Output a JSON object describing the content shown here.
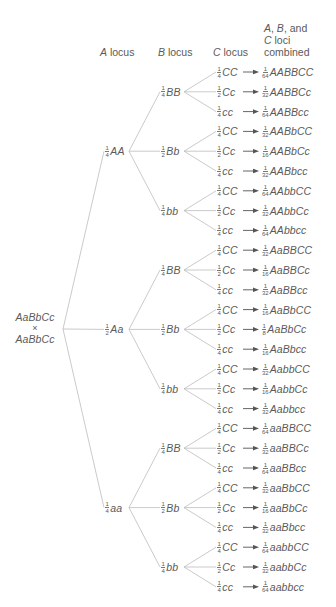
{
  "headers": {
    "a_locus": {
      "italic": "A",
      "rest": " locus"
    },
    "b_locus": {
      "italic": "B",
      "rest": " locus"
    },
    "c_locus": {
      "italic": "C",
      "rest": " locus"
    },
    "combined": {
      "line1_a": "A",
      "line1_sep": ", ",
      "line1_b": "B",
      "line1_rest": ", and",
      "line2_c": "C",
      "line2_rest": " loci",
      "line3": "combined"
    }
  },
  "root": {
    "parent1": "AaBbCc",
    "cross": "×",
    "parent2": "AaBbCc"
  },
  "a_nodes": [
    {
      "num": "1",
      "den": "4",
      "genotype": "AA"
    },
    {
      "num": "1",
      "den": "2",
      "genotype": "Aa"
    },
    {
      "num": "1",
      "den": "4",
      "genotype": "aa"
    }
  ],
  "b_nodes": [
    {
      "num": "1",
      "den": "4",
      "genotype": "BB"
    },
    {
      "num": "1",
      "den": "2",
      "genotype": "Bb"
    },
    {
      "num": "1",
      "den": "4",
      "genotype": "bb"
    },
    {
      "num": "1",
      "den": "4",
      "genotype": "BB"
    },
    {
      "num": "1",
      "den": "2",
      "genotype": "Bb"
    },
    {
      "num": "1",
      "den": "4",
      "genotype": "bb"
    },
    {
      "num": "1",
      "den": "4",
      "genotype": "BB"
    },
    {
      "num": "1",
      "den": "2",
      "genotype": "Bb"
    },
    {
      "num": "1",
      "den": "4",
      "genotype": "bb"
    }
  ],
  "rows": [
    {
      "c_num": "1",
      "c_den": "4",
      "c_genotype": "CC",
      "p_num": "1",
      "p_den": "64",
      "combined": "AABBCC"
    },
    {
      "c_num": "1",
      "c_den": "2",
      "c_genotype": "Cc",
      "p_num": "1",
      "p_den": "32",
      "combined": "AABBCc"
    },
    {
      "c_num": "1",
      "c_den": "4",
      "c_genotype": "cc",
      "p_num": "1",
      "p_den": "64",
      "combined": "AABBcc"
    },
    {
      "c_num": "1",
      "c_den": "4",
      "c_genotype": "CC",
      "p_num": "1",
      "p_den": "32",
      "combined": "AABbCC"
    },
    {
      "c_num": "1",
      "c_den": "2",
      "c_genotype": "Cc",
      "p_num": "1",
      "p_den": "16",
      "combined": "AABbCc"
    },
    {
      "c_num": "1",
      "c_den": "4",
      "c_genotype": "cc",
      "p_num": "1",
      "p_den": "32",
      "combined": "AABbcc"
    },
    {
      "c_num": "1",
      "c_den": "4",
      "c_genotype": "CC",
      "p_num": "1",
      "p_den": "64",
      "combined": "AAbbCC"
    },
    {
      "c_num": "1",
      "c_den": "2",
      "c_genotype": "Cc",
      "p_num": "1",
      "p_den": "32",
      "combined": "AAbbCc"
    },
    {
      "c_num": "1",
      "c_den": "4",
      "c_genotype": "cc",
      "p_num": "1",
      "p_den": "64",
      "combined": "AAbbcc"
    },
    {
      "c_num": "1",
      "c_den": "4",
      "c_genotype": "CC",
      "p_num": "1",
      "p_den": "32",
      "combined": "AaBBCC"
    },
    {
      "c_num": "1",
      "c_den": "2",
      "c_genotype": "Cc",
      "p_num": "1",
      "p_den": "16",
      "combined": "AaBBCc"
    },
    {
      "c_num": "1",
      "c_den": "4",
      "c_genotype": "cc",
      "p_num": "1",
      "p_den": "32",
      "combined": "AaBBcc"
    },
    {
      "c_num": "1",
      "c_den": "4",
      "c_genotype": "CC",
      "p_num": "1",
      "p_den": "16",
      "combined": "AaBbCC"
    },
    {
      "c_num": "1",
      "c_den": "2",
      "c_genotype": "Cc",
      "p_num": "1",
      "p_den": "8",
      "combined": "AaBbCc"
    },
    {
      "c_num": "1",
      "c_den": "4",
      "c_genotype": "cc",
      "p_num": "1",
      "p_den": "16",
      "combined": "AaBbcc"
    },
    {
      "c_num": "1",
      "c_den": "4",
      "c_genotype": "CC",
      "p_num": "1",
      "p_den": "32",
      "combined": "AabbCC"
    },
    {
      "c_num": "1",
      "c_den": "2",
      "c_genotype": "Cc",
      "p_num": "1",
      "p_den": "16",
      "combined": "AabbCc"
    },
    {
      "c_num": "1",
      "c_den": "4",
      "c_genotype": "cc",
      "p_num": "1",
      "p_den": "32",
      "combined": "Aabbcc"
    },
    {
      "c_num": "1",
      "c_den": "4",
      "c_genotype": "CC",
      "p_num": "1",
      "p_den": "64",
      "combined": "aaBBCC"
    },
    {
      "c_num": "1",
      "c_den": "2",
      "c_genotype": "Cc",
      "p_num": "1",
      "p_den": "32",
      "combined": "aaBBCc"
    },
    {
      "c_num": "1",
      "c_den": "4",
      "c_genotype": "cc",
      "p_num": "1",
      "p_den": "64",
      "combined": "aaBBcc"
    },
    {
      "c_num": "1",
      "c_den": "4",
      "c_genotype": "CC",
      "p_num": "1",
      "p_den": "32",
      "combined": "aaBbCC"
    },
    {
      "c_num": "1",
      "c_den": "2",
      "c_genotype": "Cc",
      "p_num": "1",
      "p_den": "16",
      "combined": "aaBbCc"
    },
    {
      "c_num": "1",
      "c_den": "4",
      "c_genotype": "cc",
      "p_num": "1",
      "p_den": "32",
      "combined": "aaBbcc"
    },
    {
      "c_num": "1",
      "c_den": "4",
      "c_genotype": "CC",
      "p_num": "1",
      "p_den": "64",
      "combined": "aabbCC"
    },
    {
      "c_num": "1",
      "c_den": "2",
      "c_genotype": "Cc",
      "p_num": "1",
      "p_den": "32",
      "combined": "aabbCc"
    },
    {
      "c_num": "1",
      "c_den": "4",
      "c_genotype": "cc",
      "p_num": "1",
      "p_den": "64",
      "combined": "aabbcc"
    }
  ],
  "colors": {
    "text": "#5a5a5a",
    "lines": "#bdbdbd",
    "arrow": "#555555"
  }
}
